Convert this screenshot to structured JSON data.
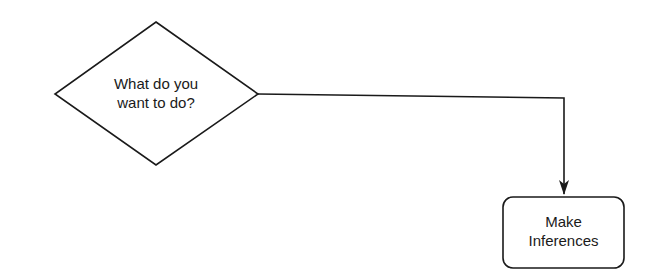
{
  "diagram": {
    "type": "flowchart",
    "nodes": [
      {
        "id": "decision",
        "shape": "diamond",
        "lines": [
          "What do you",
          "want to do?"
        ]
      },
      {
        "id": "process",
        "shape": "rounded-rectangle",
        "lines": [
          "Make",
          "Inferences"
        ]
      }
    ],
    "edges": [
      {
        "from": "decision",
        "to": "process",
        "arrow": "end"
      }
    ],
    "colors": {
      "stroke": "#1a1a1a",
      "background": "#ffffff",
      "text": "#1a1a1a"
    }
  }
}
